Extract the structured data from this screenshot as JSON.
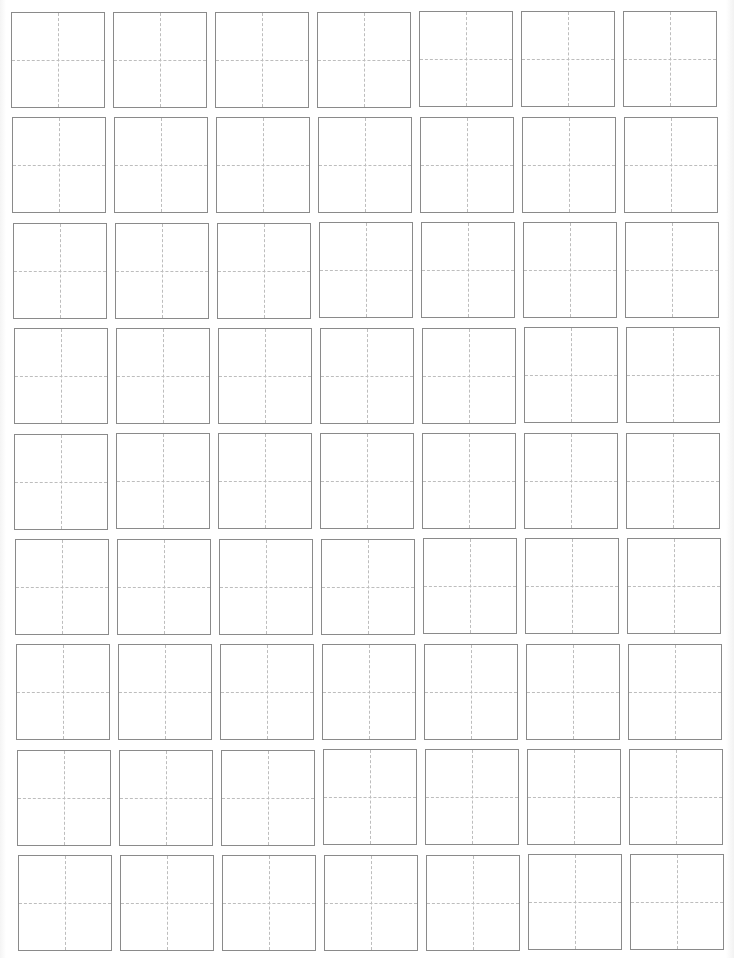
{
  "sheet": {
    "type": "tianzige-practice-grid",
    "columns": 7,
    "rows": 9,
    "cell_width": 94,
    "cell_height": 96,
    "pitch_x": 102,
    "pitch_y": 105.4,
    "origin_x": 11,
    "origin_y": 12,
    "drift_x_per_row": 0.85,
    "drift_y_per_col": -0.15,
    "border_color": "#8a8a8a",
    "guide_color": "#bdbdbd",
    "guide_style": "dashed-cross",
    "cells_text": []
  }
}
